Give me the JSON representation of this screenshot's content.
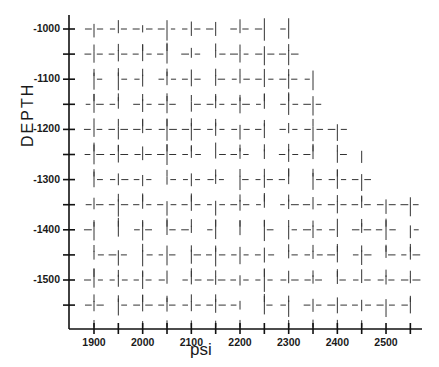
{
  "chart_data": {
    "type": "scatter",
    "title": "",
    "xlabel": "psi",
    "ylabel": "DEPTH",
    "xlim": [
      1850,
      2570
    ],
    "ylim": [
      -1580,
      -970
    ],
    "x_ticks": [
      1900,
      2000,
      2100,
      2200,
      2300,
      2400,
      2500
    ],
    "x_minor_ticks": [
      1950,
      2050,
      2150,
      2250,
      2350,
      2450,
      2550
    ],
    "y_ticks": [
      -1000,
      -1100,
      -1200,
      -1300,
      -1400,
      -1500
    ],
    "y_minor_ticks": [
      -1050,
      -1150,
      -1250,
      -1350,
      -1450,
      -1550
    ],
    "grid": "fragmented dashed cross-hatch marks",
    "legend": null,
    "marker_grid": {
      "x_step": 50,
      "y_step": 50,
      "x_start": 1900,
      "rows": [
        {
          "depth": -1000,
          "x_max": 2300
        },
        {
          "depth": -1050,
          "x_max": 2325
        },
        {
          "depth": -1100,
          "x_max": 2350
        },
        {
          "depth": -1150,
          "x_max": 2375
        },
        {
          "depth": -1200,
          "x_max": 2425
        },
        {
          "depth": -1250,
          "x_max": 2450
        },
        {
          "depth": -1300,
          "x_max": 2490
        },
        {
          "depth": -1350,
          "x_max": 2560
        },
        {
          "depth": -1400,
          "x_max": 2560
        },
        {
          "depth": -1450,
          "x_max": 2560
        },
        {
          "depth": -1500,
          "x_max": 2560
        },
        {
          "depth": -1550,
          "x_max": 2560
        }
      ]
    }
  },
  "axes": {
    "x_label": "psi",
    "y_label": "DEPTH",
    "x_tick_labels": [
      "1900",
      "2000",
      "2100",
      "2200",
      "2300",
      "2400",
      "2500"
    ],
    "y_tick_labels": [
      "-1000",
      "-1100",
      "-1200",
      "-1300",
      "-1400",
      "-1500"
    ]
  }
}
